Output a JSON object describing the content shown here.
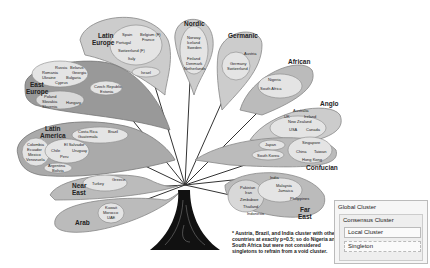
{
  "clusters": {
    "latin_europe": {
      "label_1": "Latin",
      "label_2": "Europe",
      "countries": [
        "Spain",
        "Portugal",
        "Belgium (F)",
        "France",
        "Switzerland (F)",
        "Italy",
        "Israel"
      ]
    },
    "nordic": {
      "label": "Nordic",
      "countries": [
        "Norway",
        "Iceland",
        "Sweden",
        "Finland",
        "Denmark",
        "Netherlands"
      ]
    },
    "germanic": {
      "label": "Germanic",
      "countries": [
        "Austria",
        "Germany",
        "Switzerland"
      ]
    },
    "african": {
      "label": "African",
      "countries": [
        "Nigeria",
        "South Africa"
      ]
    },
    "anglo": {
      "label": "Anglo",
      "countries": [
        "Australia",
        "UK",
        "Ireland",
        "New Zealand",
        "USA",
        "Canada"
      ]
    },
    "confucian": {
      "label": "Confucian",
      "countries": [
        "Japan",
        "South Korea",
        "Singapore",
        "China",
        "Taiwan",
        "Hong Kong"
      ]
    },
    "far_east": {
      "label_1": "Far",
      "label_2": "East",
      "countries": [
        "India",
        "Malaysia",
        "Jamaica",
        "Philippines",
        "Pakistan",
        "Iran",
        "Zimbabwe",
        "Thailand",
        "Indonesia"
      ]
    },
    "east_europe": {
      "label_1": "East",
      "label_2": "Europe",
      "countries": [
        "Russia",
        "Belarus",
        "Romania",
        "Georgia",
        "Ukraine",
        "Bulgaria",
        "Cyprus",
        "Czech Republic",
        "Estonia",
        "Poland",
        "Slovakia",
        "Slovenia",
        "Hungary"
      ]
    },
    "latin_america": {
      "label_1": "Latin",
      "label_2": "America",
      "countries": [
        "Costa Rica",
        "Guatemala",
        "Brazil",
        "Colombia",
        "Ecuador",
        "Mexico",
        "Venezuela",
        "El Salvador",
        "Chile",
        "Uruguay",
        "Peru",
        "Argentina",
        "Bolivia"
      ]
    },
    "near_east": {
      "label_1": "Near",
      "label_2": "East",
      "countries": [
        "Turkey",
        "Greece"
      ]
    },
    "arab": {
      "label": "Arab",
      "countries": [
        "Kuwait",
        "Morocco",
        "UAE"
      ]
    }
  },
  "footnote": "* Austria, Brazil, and India cluster with other countries at exactly p=0.5; so do Nigeria and South Africa but were not considered singletons to refrain from a void cluster.",
  "legend": {
    "global": "Global Cluster",
    "consensus": "Consensus Cluster",
    "local": "Local Cluster",
    "singleton": "Singleton"
  }
}
